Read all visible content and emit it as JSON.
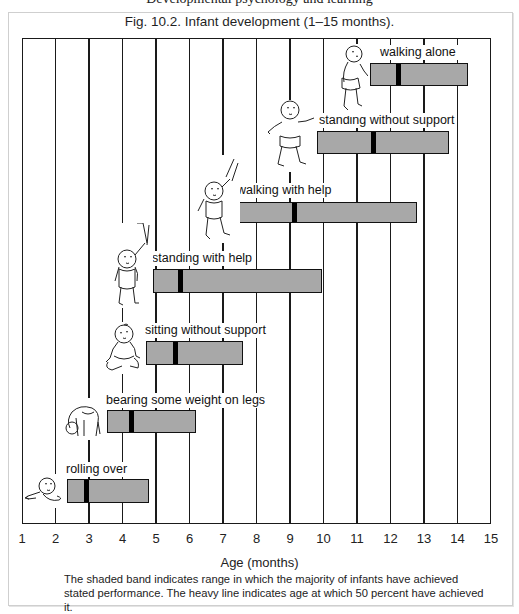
{
  "page": {
    "cut_header_text": "Developmental psychology and learning"
  },
  "figure": {
    "title": "Fig. 10.2. Infant development (1–15 months).",
    "xlabel": "Age (months)",
    "caption": "The shaded band indicates range in which the majority of infants have achieved stated performance. The heavy line indicates age at which 50 percent have achieved it.",
    "ticks": [
      "1",
      "2",
      "3",
      "4",
      "5",
      "6",
      "7",
      "8",
      "9",
      "10",
      "11",
      "12",
      "13",
      "14",
      "15"
    ],
    "colors": {
      "band": "#a8a8a8",
      "median": "#000000",
      "border": "#1a1a1a"
    }
  },
  "milestones": [
    {
      "label": "rolling over",
      "icon": "baby-lying-icon"
    },
    {
      "label": "bearing some weight on legs",
      "icon": "baby-crawling-icon"
    },
    {
      "label": "sitting without support",
      "icon": "baby-sitting-icon"
    },
    {
      "label": "standing with help",
      "icon": "baby-standing-help-icon"
    },
    {
      "label": "walking with help",
      "icon": "baby-walking-help-icon"
    },
    {
      "label": "standing without support",
      "icon": "baby-standing-icon"
    },
    {
      "label": "walking alone",
      "icon": "baby-walking-icon"
    }
  ],
  "chart_data": {
    "type": "bar",
    "subtype": "range (floating horizontal bars with median marker)",
    "title": "Fig. 10.2. Infant development (1–15 months).",
    "xlabel": "Age (months)",
    "ylabel": "",
    "xlim": [
      1,
      15
    ],
    "grid": "vertical lines at each month",
    "legend": "none",
    "categories": [
      "rolling over",
      "bearing some weight on legs",
      "sitting without support",
      "standing with help",
      "walking with help",
      "standing without support",
      "walking alone"
    ],
    "series": [
      {
        "name": "range start (months)",
        "values": [
          2.35,
          3.55,
          4.7,
          4.9,
          7.4,
          9.8,
          11.4
        ]
      },
      {
        "name": "range end (months)",
        "values": [
          4.8,
          6.2,
          7.6,
          9.95,
          12.8,
          13.75,
          14.3
        ]
      },
      {
        "name": "50 percent achieved (months)",
        "values": [
          2.9,
          4.25,
          5.55,
          5.7,
          9.1,
          11.45,
          12.2
        ]
      }
    ],
    "annotations": [
      "The shaded band indicates range in which the majority of infants have achieved stated performance. The heavy line indicates age at which 50 percent have achieved it."
    ]
  }
}
